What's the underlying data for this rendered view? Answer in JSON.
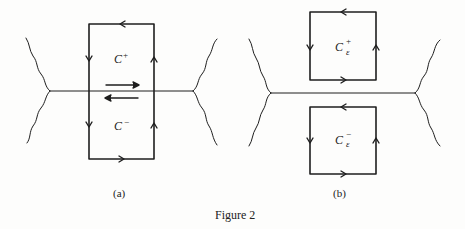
{
  "figure": {
    "caption": "Figure 2",
    "panels": [
      {
        "id": "a",
        "label": "(a)",
        "contour_labels": {
          "upper": {
            "main": "C",
            "sup": "+"
          },
          "lower": {
            "main": "C",
            "sup": "−"
          }
        }
      },
      {
        "id": "b",
        "label": "(b)",
        "contour_labels": {
          "upper": {
            "main": "C",
            "sup": "+",
            "sub": "ε"
          },
          "lower": {
            "main": "C",
            "sup": "−",
            "sub": "ε"
          }
        }
      }
    ]
  },
  "colors": {
    "ink": "#1e1e1e",
    "background": "#fdfdfc"
  }
}
